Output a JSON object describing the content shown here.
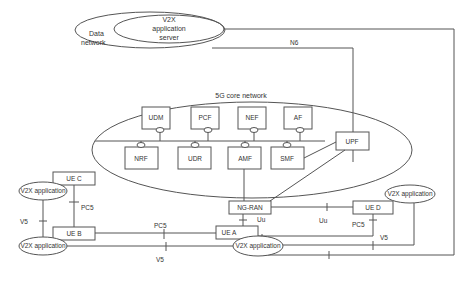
{
  "diagram": {
    "data_network": {
      "label_line1": "Data",
      "label_line2": "network"
    },
    "app_server": {
      "line1": "V2X",
      "line2": "application",
      "line3": "server"
    },
    "n6_label": "N6",
    "core": {
      "title": "5G core network",
      "top_nfs": [
        "UDM",
        "PCF",
        "NEF",
        "AF"
      ],
      "bottom_nfs": [
        "NRF",
        "UDR",
        "AMF",
        "SMF"
      ],
      "upf": "UPF"
    },
    "ran": "NG-RAN",
    "ues": {
      "a": "UE A",
      "b": "UE B",
      "c": "UE C",
      "d": "UE D"
    },
    "apps": {
      "label": "V2X application"
    },
    "interfaces": {
      "uu": "Uu",
      "pc5": "PC5",
      "v5": "V5"
    }
  }
}
